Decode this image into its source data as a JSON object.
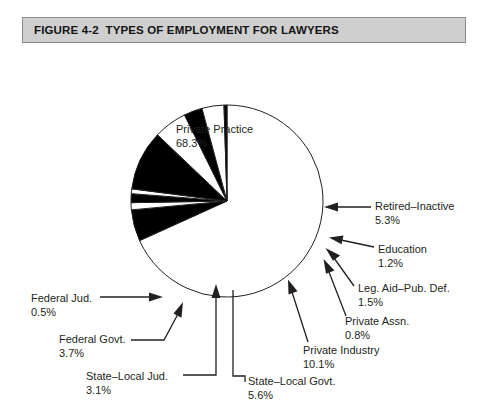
{
  "figure": {
    "number": "FIGURE 4-2",
    "title": "TYPES OF EMPLOYMENT FOR LAWYERS",
    "title_full": "FIGURE 4-2  TYPES OF EMPLOYMENT FOR LAWYERS",
    "title_bar_color": "#cfcfcf",
    "title_bar_border_color": "#8a8a8a"
  },
  "labels": {
    "private_practice": {
      "name": "Private Practice",
      "value": "68.3%"
    },
    "retired_inactive": {
      "name": "Retired–Inactive",
      "value": "5.3%"
    },
    "education": {
      "name": "Education",
      "value": "1.2%"
    },
    "legal_aid": {
      "name": "Leg. Aid–Pub. Def.",
      "value": "1.5%"
    },
    "private_assn": {
      "name": "Private Assn.",
      "value": "0.8%"
    },
    "private_industry": {
      "name": "Private Industry",
      "value": "10.1%"
    },
    "state_local_govt": {
      "name": "State–Local Govt.",
      "value": "5.6%"
    },
    "state_local_jud": {
      "name": "State–Local Jud.",
      "value": "3.1%"
    },
    "federal_govt": {
      "name": "Federal Govt.",
      "value": "3.7%"
    },
    "federal_jud": {
      "name": "Federal Jud.",
      "value": "0.5%"
    }
  },
  "chart_data": {
    "type": "pie",
    "title": "FIGURE 4-2  TYPES OF EMPLOYMENT FOR LAWYERS",
    "xlabel": "",
    "ylabel": "",
    "units": "percent",
    "total": 100.1,
    "legend_position": "callout-labels",
    "grid": false,
    "categories": [
      "Private Practice",
      "Retired–Inactive",
      "Education",
      "Leg. Aid–Pub. Def.",
      "Private Assn.",
      "Private Industry",
      "State–Local Govt.",
      "State–Local Jud.",
      "Federal Govt.",
      "Federal Jud."
    ],
    "values": [
      68.3,
      5.3,
      1.2,
      1.5,
      0.8,
      10.1,
      5.6,
      3.1,
      3.7,
      0.5
    ],
    "slice_fills": [
      "#ffffff",
      "#000000",
      "#ffffff",
      "#000000",
      "#ffffff",
      "#000000",
      "#ffffff",
      "#000000",
      "#ffffff",
      "#000000"
    ],
    "stroke_color": "#231f20",
    "start_angle_deg": -90,
    "direction": "clockwise",
    "geometry": {
      "cx": 227,
      "cy": 157,
      "r": 96
    }
  }
}
